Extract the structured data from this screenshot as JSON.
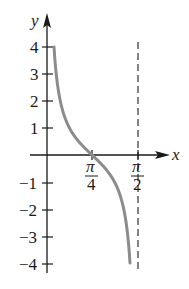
{
  "chart_data": {
    "type": "line",
    "title": "",
    "function": "y = cot(2x)",
    "xlabel": "x",
    "ylabel": "y",
    "x_ticks": [
      {
        "value": 0.7854,
        "label_num": "π",
        "label_den": "4"
      },
      {
        "value": 1.5708,
        "label_num": "π",
        "label_den": "2"
      }
    ],
    "y_ticks": [
      {
        "value": 4,
        "label": "4"
      },
      {
        "value": 3,
        "label": "3"
      },
      {
        "value": 2,
        "label": "2"
      },
      {
        "value": 1,
        "label": "1"
      },
      {
        "value": -1,
        "label": "−1"
      },
      {
        "value": -2,
        "label": "−2"
      },
      {
        "value": -3,
        "label": "−3"
      },
      {
        "value": -4,
        "label": "−4"
      }
    ],
    "xlim": [
      0,
      1.5708
    ],
    "ylim": [
      -4,
      4
    ],
    "asymptote": {
      "x": 1.5708,
      "style": "dashed"
    },
    "series": [
      {
        "name": "cot(2x)",
        "color": "#8c8c8c",
        "x": [
          0.1225,
          0.2,
          0.3,
          0.4,
          0.5,
          0.6,
          0.7854,
          0.9,
          1.0,
          1.1,
          1.2,
          1.3,
          1.4,
          1.4483
        ],
        "y": [
          4.0,
          2.365,
          1.462,
          0.971,
          0.642,
          0.397,
          0.0,
          -0.233,
          -0.458,
          -0.712,
          -1.054,
          -1.588,
          -2.636,
          -4.0
        ]
      }
    ],
    "grid": false,
    "legend": null
  },
  "labels": {
    "x_axis": "x",
    "y_axis": "y"
  },
  "colors": {
    "axis": "#1a1a1a",
    "curve": "#8c8c8c",
    "asymptote": "#333333"
  }
}
